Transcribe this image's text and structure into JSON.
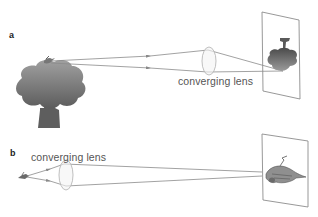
{
  "panels": [
    {
      "id": "a",
      "label": "a",
      "lens_label": "converging lens",
      "object": "tree-with-bird",
      "image": "inverted-tree-image"
    },
    {
      "id": "b",
      "label": "b",
      "lens_label": "converging lens",
      "object": "bird",
      "image": "inverted-bird-image"
    }
  ],
  "colors": {
    "ray": "#8a8a8a",
    "lens_stroke": "#b5b5b5",
    "screen_stroke": "#8c8c8c",
    "tree_fill_top": "#9a9a9a",
    "tree_fill_bottom": "#5a5a5a",
    "text": "#555555"
  }
}
